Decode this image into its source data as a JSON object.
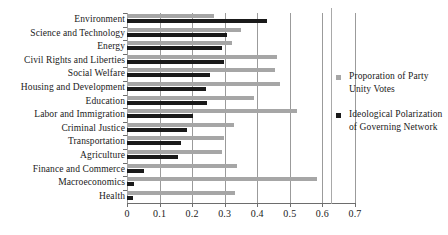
{
  "chart_data": {
    "type": "bar",
    "orientation": "horizontal",
    "title": "",
    "xlabel": "",
    "ylabel": "",
    "xlim": [
      0,
      0.7
    ],
    "xticks": [
      "0",
      "0.1",
      "0.2",
      "0.3",
      "0.4",
      "0.5",
      "0.6",
      "0.7"
    ],
    "xtick_values": [
      0,
      0.1,
      0.2,
      0.3,
      0.4,
      0.5,
      0.6,
      0.7
    ],
    "grid": true,
    "grid_axis": "x",
    "legend_position": "right",
    "categories": [
      "Environment",
      "Science and Technology",
      "Energy",
      "Civil Rights and Liberties",
      "Social Welfare",
      "Housing and Development",
      "Education",
      "Labor and Immigration",
      "Criminal Justice",
      "Transportation",
      "Agriculture",
      "Finance and Commerce",
      "Macroeconomics",
      "Health"
    ],
    "series": [
      {
        "name": "Proporation of Party Unity Votes",
        "color": "#a6a6a6",
        "values": [
          0.267,
          0.349,
          0.323,
          0.459,
          0.453,
          0.469,
          0.39,
          0.522,
          0.328,
          0.298,
          0.292,
          0.338,
          0.584,
          0.331
        ]
      },
      {
        "name": "Ideological Polarization of Governing Network",
        "color": "#1a1a1a",
        "values": [
          0.429,
          0.306,
          0.292,
          0.298,
          0.255,
          0.244,
          0.246,
          0.204,
          0.185,
          0.165,
          0.157,
          0.052,
          0.021,
          0.019
        ]
      }
    ]
  },
  "legend": {
    "items": [
      {
        "label": "Proporation of Party Unity Votes",
        "swatch": "gray",
        "swatch_color": "#a6a6a6"
      },
      {
        "label": "Ideological Polarization of Governing Network",
        "swatch": "black",
        "swatch_color": "#1a1a1a"
      }
    ]
  }
}
